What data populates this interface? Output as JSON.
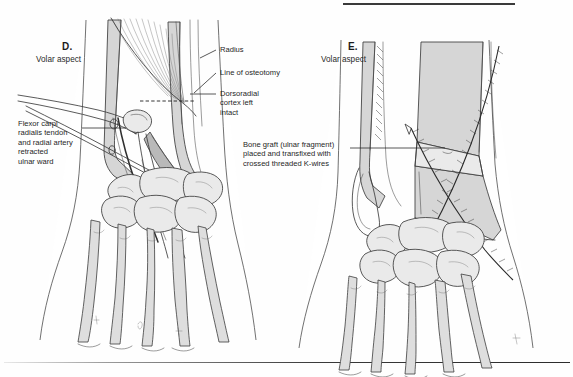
{
  "figure": {
    "type": "medical-illustration",
    "background_color": "#fefefe",
    "ink_color": "#3c3c3c",
    "bone_shade_color": "#d6d6d6"
  },
  "rules": {
    "top_rule_present": true,
    "bottom_rule_present": true
  },
  "panels": [
    {
      "id": "D",
      "letter": "D.",
      "subtitle": "Volar aspect",
      "annotations": [
        {
          "name": "radius",
          "text": "Radius",
          "side": "right"
        },
        {
          "name": "line-of-osteotomy",
          "text": "Line of osteotomy",
          "side": "right"
        },
        {
          "name": "dorsoradial-cortex",
          "text": "Dorsoradial\ncortex left\nintact",
          "side": "right"
        },
        {
          "name": "flexor-carpi-radialis",
          "text": "Flexor carpi\nradialis tendon\nand radial artery\nretracted\nulnar ward",
          "side": "left"
        }
      ]
    },
    {
      "id": "E",
      "letter": "E.",
      "subtitle": "Volar aspect",
      "annotations": [
        {
          "name": "bone-graft",
          "text": "Bone graft (ulnar fragment)\nplaced and transfixed with\ncrossed threaded K-wires",
          "side": "left"
        }
      ]
    }
  ]
}
